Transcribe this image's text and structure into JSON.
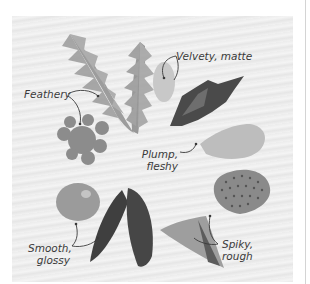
{
  "figure": {
    "labels": {
      "feathery": "Feathery",
      "velvety": "Velvety, matte",
      "plump_line1": "Plump,",
      "plump_line2": "fleshy",
      "smooth_line1": "Smooth,",
      "smooth_line2": "glossy",
      "spiky_line1": "Spiky,",
      "spiky_line2": "rough"
    },
    "specimens": [
      {
        "name": "fern-frond",
        "texture": "Feathery"
      },
      {
        "name": "lambs-ear-leaf",
        "texture": "Velvety, matte"
      },
      {
        "name": "dark-crinkled-leaf",
        "texture": "Velvety, matte"
      },
      {
        "name": "succulent-leaf",
        "texture": "Plump, fleshy"
      },
      {
        "name": "lobed-geranium-leaf",
        "texture": "Feathery"
      },
      {
        "name": "round-glossy-leaf",
        "texture": "Smooth, glossy"
      },
      {
        "name": "dark-pointed-leaves",
        "texture": "Smooth, glossy"
      },
      {
        "name": "spotted-cactus-pad",
        "texture": "Spiky, rough"
      },
      {
        "name": "triangular-leaf",
        "texture": "Spiky, rough"
      }
    ],
    "colors": {
      "background": "#efefef",
      "text": "#3a3a3a",
      "leader_line": "#3a3a3a"
    }
  }
}
